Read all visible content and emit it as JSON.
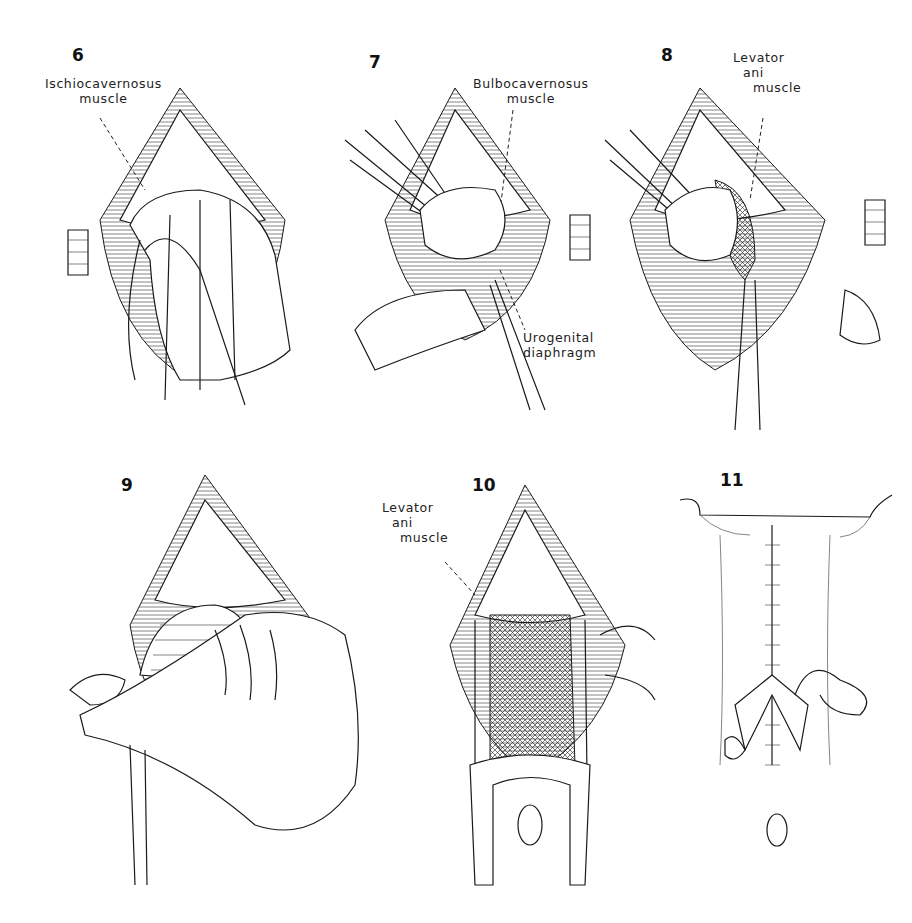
{
  "figure": {
    "panels": [
      {
        "number": "6",
        "labels": [
          {
            "text_line1": "Ischiocavernosus",
            "text_line2": "muscle"
          }
        ]
      },
      {
        "number": "7",
        "labels": [
          {
            "text_line1": "Bulbocavernosus",
            "text_line2": "muscle"
          },
          {
            "text_line1": "Urogenital",
            "text_line2": "diaphragm"
          }
        ]
      },
      {
        "number": "8",
        "labels": [
          {
            "text_line1": "Levator",
            "text_line2": "ani",
            "text_line3": "muscle"
          }
        ]
      },
      {
        "number": "9",
        "labels": []
      },
      {
        "number": "10",
        "labels": [
          {
            "text_line1": "Levator",
            "text_line2": "ani",
            "text_line3": "muscle"
          }
        ]
      },
      {
        "number": "11",
        "labels": []
      }
    ]
  },
  "colors": {
    "ink": "#1a1a1a",
    "background": "#ffffff"
  }
}
